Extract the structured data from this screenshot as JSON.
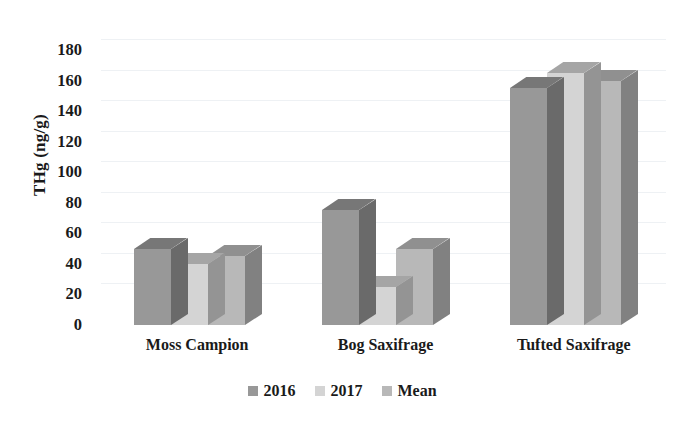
{
  "chart_data": {
    "type": "bar",
    "title": "",
    "subtitle": "",
    "xlabel": "",
    "ylabel": "THg (ng/g)",
    "categories": [
      "Moss Campion",
      "Bog Saxifrage",
      "Tufted Saxifrage"
    ],
    "series": [
      {
        "name": "2016",
        "values": [
          50,
          75,
          155
        ],
        "color": "#989898"
      },
      {
        "name": "2017",
        "values": [
          40,
          25,
          165
        ],
        "color": "#d4d4d4"
      },
      {
        "name": "Mean",
        "values": [
          45,
          50,
          160
        ],
        "color": "#b8b8b8"
      }
    ],
    "ylim": [
      0,
      180
    ],
    "ytick_step": 20,
    "yticks": [
      180,
      160,
      140,
      120,
      100,
      80,
      60,
      40,
      20,
      0
    ],
    "grid": true,
    "grid_color": "#eef1f4",
    "legend_position": "bottom",
    "three_d": true,
    "background": "#ffffff",
    "text_color": "#1a1a1a"
  },
  "legend": {
    "items": [
      {
        "label": "2016",
        "color": "#989898"
      },
      {
        "label": "2017",
        "color": "#d4d4d4"
      },
      {
        "label": "Mean",
        "color": "#b8b8b8"
      }
    ]
  }
}
